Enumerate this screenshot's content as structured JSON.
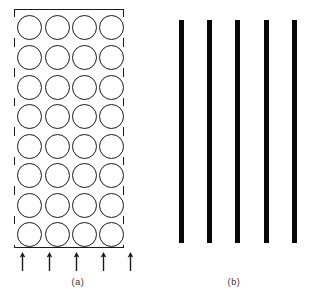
{
  "figure": {
    "background_color": "#ffffff",
    "line_color": "#1a1a1a",
    "fill_color": "#080808",
    "width": 312,
    "height": 299
  },
  "panel_a": {
    "caption": "(a)",
    "name": "circle-array-panel",
    "box": {
      "x": 14,
      "y": 9,
      "width": 110,
      "height": 239,
      "stroke_color": "#1a1a1a",
      "fill": "none"
    },
    "grid": {
      "rows": 8,
      "columns": 4,
      "total_circles": 32,
      "circle_diameter": 25,
      "column_centers": [
        15,
        43,
        70,
        97
      ],
      "row_centers": [
        18,
        48,
        78,
        107,
        137,
        166,
        196,
        225
      ]
    },
    "arrows": {
      "count": 5,
      "direction": "up",
      "y": 252,
      "x_positions": [
        8,
        35,
        62,
        89,
        116
      ],
      "label": "arrow-up"
    },
    "side_segments": {
      "left_x": 0,
      "right_x": 109,
      "segment_gaps_description": "vertical border interrupted where circles meet the edge"
    }
  },
  "panel_b": {
    "caption": "(b)",
    "name": "solid-bars-panel",
    "bars": {
      "count": 5,
      "top": 20,
      "bottom": 243,
      "height": 223,
      "width": 5,
      "x_positions": [
        23,
        51,
        79,
        108,
        136
      ],
      "color": "#080808"
    }
  },
  "chart_data": {
    "type": "diagram",
    "title": "",
    "panels": [
      {
        "label": "(a)",
        "element": "rectangular array of open circles",
        "rows": 8,
        "columns": 4,
        "markers": 32,
        "annotation_arrows": 5
      },
      {
        "label": "(b)",
        "element": "vertical solid bars",
        "bars": 5
      }
    ]
  }
}
